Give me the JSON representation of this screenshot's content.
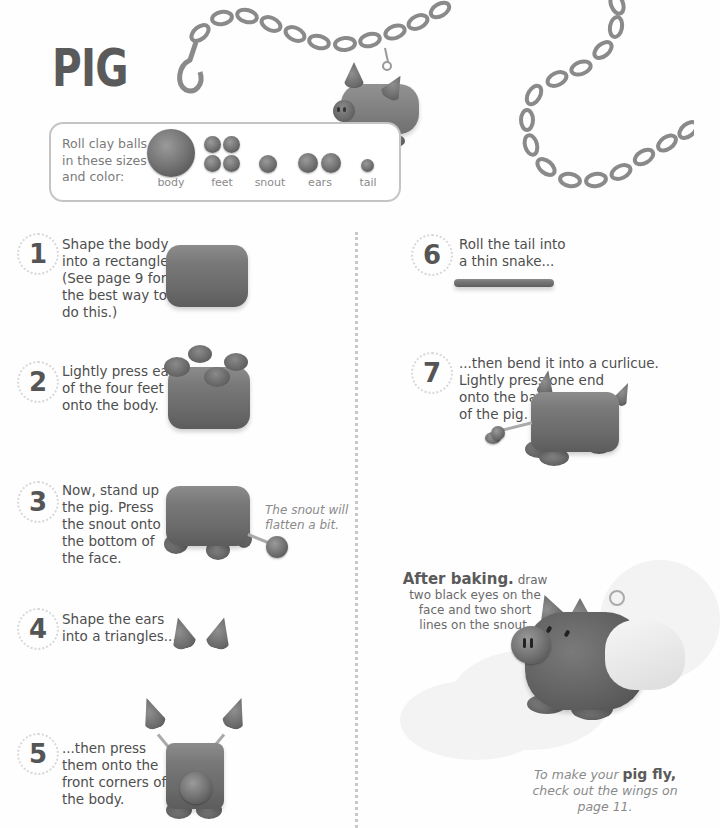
{
  "page": {
    "title": "PIG"
  },
  "balls": {
    "intro_lines": [
      "Roll clay balls",
      "in these sizes",
      "and color:"
    ],
    "items": [
      {
        "label": "body",
        "count": 1,
        "size": "large"
      },
      {
        "label": "feet",
        "count": 4,
        "size": "medium"
      },
      {
        "label": "snout",
        "count": 1,
        "size": "small-medium"
      },
      {
        "label": "ears",
        "count": 2,
        "size": "medium"
      },
      {
        "label": "tail",
        "count": 1,
        "size": "small"
      }
    ]
  },
  "steps": [
    {
      "number": "1",
      "lines": [
        "Shape the body",
        "into a rectangle.",
        "(See page 9 for",
        "the best way to",
        "do this.)"
      ]
    },
    {
      "number": "2",
      "lines": [
        "Lightly press each",
        "of the four feet",
        "onto the body."
      ]
    },
    {
      "number": "3",
      "lines": [
        "Now, stand up",
        "the pig. Press",
        "the snout onto",
        "the bottom of",
        "the face."
      ],
      "note_lines": [
        "The snout will",
        "flatten a bit."
      ]
    },
    {
      "number": "4",
      "lines": [
        "Shape the ears",
        "into a triangles..."
      ]
    },
    {
      "number": "5",
      "lines": [
        "...then press",
        "them onto the",
        "front corners of",
        "the body."
      ]
    },
    {
      "number": "6",
      "lines": [
        "Roll the tail into",
        "a thin snake..."
      ]
    },
    {
      "number": "7",
      "lines": [
        "...then bend it into a curlicue.",
        "Lightly press one end",
        "onto the back",
        "of the pig."
      ]
    }
  ],
  "after_baking": {
    "heading": "After baking.",
    "line1_rest": " draw",
    "lines": [
      "two black eyes on the",
      "face and two short",
      "lines on the snout."
    ]
  },
  "wings_note": {
    "prefix": "To make your ",
    "highlight": "pig fly,",
    "lines": [
      "check out the wings on",
      "page 11."
    ]
  },
  "colors": {
    "clay": "#777777",
    "text": "#4e4e4e",
    "title": "#5a5a5a",
    "box_border": "#c4c4c4",
    "divider": "#c8c8c8"
  }
}
